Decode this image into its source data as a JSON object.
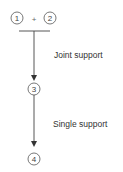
{
  "diagram": {
    "nodes": [
      {
        "id": "1",
        "label": "1"
      },
      {
        "id": "2",
        "label": "2"
      },
      {
        "id": "3",
        "label": "3"
      },
      {
        "id": "4",
        "label": "4"
      }
    ],
    "join_symbol": "+",
    "edges": [
      {
        "from": [
          "1",
          "2"
        ],
        "to": "3",
        "label": "Joint support"
      },
      {
        "from": [
          "3"
        ],
        "to": "4",
        "label": "Single support"
      }
    ]
  }
}
